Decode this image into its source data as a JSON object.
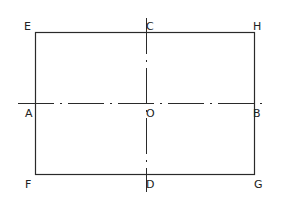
{
  "diagram": {
    "type": "rectangle-with-centerlines",
    "labels": {
      "E": "E",
      "C": "C",
      "H": "H",
      "A": "A",
      "O": "O",
      "B": "B",
      "F": "F",
      "D": "D",
      "G": "G"
    },
    "rectangle": {
      "corners": [
        "E",
        "H",
        "G",
        "F"
      ]
    },
    "centerlines": [
      {
        "from": "A",
        "to": "B",
        "style": "dash-dot",
        "orientation": "horizontal"
      },
      {
        "from": "C",
        "to": "D",
        "style": "dash-dot",
        "orientation": "vertical"
      }
    ],
    "center_point": "O",
    "colors": {
      "line": "#2a2a2a",
      "background": "#ffffff"
    }
  }
}
